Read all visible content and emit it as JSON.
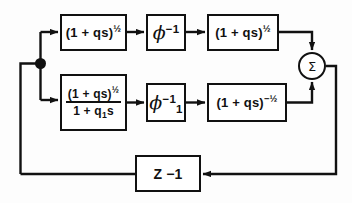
{
  "diagram": {
    "stroke_color": "#111111",
    "background_color": "#fdfdfd",
    "blocks": [
      {
        "id": "top_gain_1",
        "name": "top-forward-gain-block",
        "base": "(1 + qs)",
        "exponent": "½",
        "row": "top"
      },
      {
        "id": "phi_inverse",
        "name": "phi-inverse-block",
        "symbol": "ϕ",
        "exponent": "−1",
        "subscript": "",
        "row": "top"
      },
      {
        "id": "top_gain_2",
        "name": "top-output-gain-block",
        "base": "(1 + qs)",
        "exponent": "½",
        "row": "top"
      },
      {
        "id": "fraction_block",
        "name": "lower-transfer-function-block",
        "numerator_base": "(1 + qs)",
        "numerator_exponent": "½",
        "denominator": "1 + q",
        "denominator_subscript": "1",
        "denominator_tail": "s",
        "row": "bottom"
      },
      {
        "id": "phi_1_inverse",
        "name": "phi-one-inverse-block",
        "symbol": "ϕ",
        "exponent": "−1",
        "subscript": "1",
        "row": "bottom"
      },
      {
        "id": "bottom_gain",
        "name": "lower-output-gain-block",
        "base": "(1 + qs)",
        "exponent": "−½",
        "row": "bottom"
      },
      {
        "id": "feedback_block",
        "name": "feedback-delay-block",
        "label": "Z −1",
        "row": "feedback"
      }
    ],
    "summing_junction": {
      "name": "summing-junction",
      "symbol": "Σ"
    },
    "branch_point": {
      "name": "branch-point",
      "label": ""
    }
  }
}
